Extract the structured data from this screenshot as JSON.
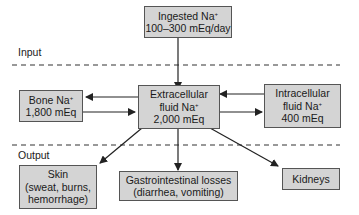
{
  "sections": {
    "input_label": "Input",
    "output_label": "Output"
  },
  "nodes": {
    "ingested": {
      "line1": "Ingested Na",
      "sup": "+",
      "line2": "100–300 mEq/day"
    },
    "bone": {
      "line1": "Bone Na",
      "sup": "+",
      "line2": "1,800 mEq"
    },
    "ecf": {
      "line1": "Extracellular",
      "line2a": "fluid Na",
      "sup": "+",
      "line3": "2,000 mEq"
    },
    "icf": {
      "line1": "Intracellular",
      "line2a": "fluid Na",
      "sup": "+",
      "line3": "400 mEq"
    },
    "skin": {
      "line1": "Skin",
      "line2": "(sweat, burns,",
      "line3": "hemorrhage)"
    },
    "gi": {
      "line1": "Gastrointestinal losses",
      "line2": "(diarrhea, vomiting)"
    },
    "kidneys": {
      "line1": "Kidneys"
    }
  }
}
